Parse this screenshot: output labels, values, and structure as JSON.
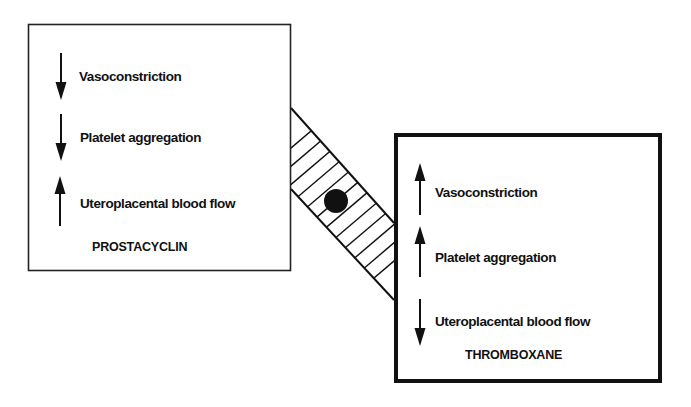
{
  "diagram": {
    "type": "comparison",
    "connector": {
      "description": "hatched band joining the two boxes",
      "marker": "filled-circle"
    },
    "colors": {
      "ink": "#111111",
      "background": "#ffffff"
    },
    "prostacyclin": {
      "title": "PROSTACYCLIN",
      "effects": [
        {
          "label": "Vasoconstriction",
          "direction": "down",
          "icon": "arrow-down-icon"
        },
        {
          "label": "Platelet aggregation",
          "direction": "down",
          "icon": "arrow-down-icon"
        },
        {
          "label": "Uteroplacental blood flow",
          "direction": "up",
          "icon": "arrow-up-icon"
        }
      ]
    },
    "thromboxane": {
      "title": "THROMBOXANE",
      "effects": [
        {
          "label": "Vasoconstriction",
          "direction": "up",
          "icon": "arrow-up-icon"
        },
        {
          "label": "Platelet aggregation",
          "direction": "up",
          "icon": "arrow-up-icon"
        },
        {
          "label": "Uteroplacental blood flow",
          "direction": "down",
          "icon": "arrow-down-icon"
        }
      ]
    }
  }
}
